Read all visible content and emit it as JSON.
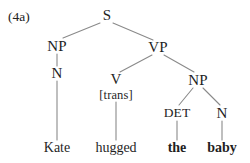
{
  "figure": {
    "example_label": "(4a)",
    "sentence": "Kate hugged the baby",
    "line_color": "#8a8a8a",
    "text_color": "#1f1f1f",
    "background_color": "#ffffff"
  },
  "tree": {
    "nodes": {
      "s": {
        "label": "S",
        "x": 107,
        "y": 15
      },
      "np_subject": {
        "label": "NP",
        "x": 57,
        "y": 46
      },
      "vp": {
        "label": "VP",
        "x": 158,
        "y": 47
      },
      "n_subject": {
        "label": "N",
        "x": 57,
        "y": 73
      },
      "v": {
        "label": "V",
        "x": 116,
        "y": 79
      },
      "v_feature": {
        "label": "[trans]",
        "x": 116,
        "y": 95
      },
      "np_object": {
        "label": "NP",
        "x": 198,
        "y": 80
      },
      "det": {
        "label": "DET",
        "x": 177,
        "y": 113
      },
      "n_object": {
        "label": "N",
        "x": 222,
        "y": 113
      }
    },
    "leaves": {
      "kate": {
        "label": "Kate",
        "x": 57,
        "y": 148,
        "bold": false
      },
      "hugged": {
        "label": "hugged",
        "x": 116,
        "y": 148,
        "bold": false
      },
      "the": {
        "label": "the",
        "x": 177,
        "y": 148,
        "bold": true
      },
      "baby": {
        "label": "baby",
        "x": 222,
        "y": 148,
        "bold": true
      }
    },
    "edges": [
      {
        "name": "s-to-np-subject",
        "x1": 100,
        "y1": 23,
        "x2": 63,
        "y2": 38
      },
      {
        "name": "s-to-vp",
        "x1": 113,
        "y1": 23,
        "x2": 153,
        "y2": 40
      },
      {
        "name": "np-subject-to-n",
        "x1": 57,
        "y1": 54,
        "x2": 57,
        "y2": 66
      },
      {
        "name": "vp-to-v",
        "x1": 152,
        "y1": 55,
        "x2": 120,
        "y2": 72
      },
      {
        "name": "vp-to-np-object",
        "x1": 164,
        "y1": 55,
        "x2": 194,
        "y2": 72
      },
      {
        "name": "n-subject-to-kate",
        "x1": 57,
        "y1": 81,
        "x2": 57,
        "y2": 140
      },
      {
        "name": "v-to-hugged",
        "x1": 116,
        "y1": 102,
        "x2": 116,
        "y2": 140
      },
      {
        "name": "np-object-to-det",
        "x1": 193,
        "y1": 88,
        "x2": 179,
        "y2": 105
      },
      {
        "name": "np-object-to-n",
        "x1": 203,
        "y1": 88,
        "x2": 220,
        "y2": 105
      },
      {
        "name": "det-to-the",
        "x1": 177,
        "y1": 121,
        "x2": 177,
        "y2": 140
      },
      {
        "name": "n-object-to-baby",
        "x1": 222,
        "y1": 121,
        "x2": 222,
        "y2": 140
      }
    ]
  }
}
